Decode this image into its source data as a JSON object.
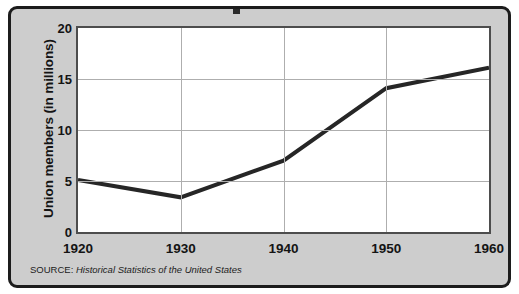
{
  "figure": {
    "source_label": "SOURCE:",
    "source_title": "Historical Statistics of the United States",
    "frame_color": "#1c1c1c",
    "panel_background": "#cdcdcd",
    "plot_background": "#ffffff"
  },
  "chart_data": {
    "type": "line",
    "title": "",
    "xlabel": "",
    "ylabel": "Union members (in millions)",
    "x": [
      1920,
      1930,
      1940,
      1950,
      1960
    ],
    "values": [
      5.1,
      3.4,
      7.0,
      14.1,
      16.1
    ],
    "series": [
      {
        "name": "Union members",
        "values": [
          5.1,
          3.4,
          7.0,
          14.1,
          16.1
        ],
        "color": "#262626",
        "line_width": 4
      }
    ],
    "xlim": [
      1920,
      1960
    ],
    "ylim": [
      0,
      20
    ],
    "xticks": [
      1920,
      1930,
      1940,
      1950,
      1960
    ],
    "xtick_labels": [
      "1920",
      "1930",
      "1940",
      "1950",
      "1960"
    ],
    "yticks": [
      0,
      5,
      10,
      15,
      20
    ],
    "ytick_labels": [
      "0",
      "5",
      "10",
      "15",
      "20"
    ],
    "grid": true,
    "grid_color": "#aeaeae",
    "legend": false
  }
}
